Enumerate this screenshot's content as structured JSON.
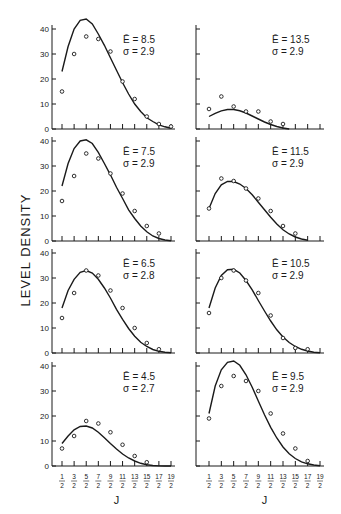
{
  "figure": {
    "y_axis_label": "LEVEL  DENSITY",
    "x_axis_label": "J",
    "x_tick_labels": [
      {
        "num": "1",
        "den": "2"
      },
      {
        "num": "3",
        "den": "2"
      },
      {
        "num": "5",
        "den": "2"
      },
      {
        "num": "7",
        "den": "2"
      },
      {
        "num": "9",
        "den": "2"
      },
      {
        "num": "11",
        "den": "2"
      },
      {
        "num": "13",
        "den": "2"
      },
      {
        "num": "15",
        "den": "2"
      },
      {
        "num": "17",
        "den": "2"
      },
      {
        "num": "19",
        "den": "2"
      }
    ],
    "y_tick_labels": [
      "0",
      "10",
      "20",
      "30",
      "40"
    ]
  },
  "chart_data": [
    {
      "type": "scatter",
      "panel": "left-1",
      "annotation": {
        "E": "Ē = 8.5",
        "sigma": "σ = 2.9"
      },
      "x": [
        0.5,
        1.5,
        2.5,
        3.5,
        4.5,
        5.5,
        6.5,
        7.5,
        8.5,
        9.5
      ],
      "points": [
        15,
        30,
        37,
        36,
        31,
        19,
        12,
        5,
        2,
        1
      ],
      "curve": [
        [
          0.5,
          23
        ],
        [
          1.0,
          33
        ],
        [
          1.5,
          40
        ],
        [
          2.0,
          43.5
        ],
        [
          2.5,
          44
        ],
        [
          3.0,
          42
        ],
        [
          3.5,
          38
        ],
        [
          4.0,
          33.5
        ],
        [
          4.5,
          28.5
        ],
        [
          5.0,
          23.5
        ],
        [
          5.5,
          18.5
        ],
        [
          6.0,
          14
        ],
        [
          6.5,
          10
        ],
        [
          7.0,
          7
        ],
        [
          7.5,
          4.5
        ],
        [
          8.0,
          3
        ],
        [
          8.5,
          1.7
        ],
        [
          9.0,
          0.9
        ],
        [
          9.5,
          0.3
        ]
      ],
      "xlabel": "J",
      "ylabel": "LEVEL DENSITY",
      "ylim": [
        0,
        45
      ]
    },
    {
      "type": "scatter",
      "panel": "right-1",
      "annotation": {
        "E": "Ē = 13.5",
        "sigma": "σ = 2.9"
      },
      "x": [
        0.5,
        1.5,
        2.5,
        3.5,
        4.5,
        5.5,
        6.5
      ],
      "points": [
        8,
        13,
        9,
        7,
        7,
        3,
        2
      ],
      "curve": [
        [
          0.5,
          5
        ],
        [
          1.0,
          6.3
        ],
        [
          1.5,
          7.3
        ],
        [
          2.0,
          7.8
        ],
        [
          2.5,
          7.8
        ],
        [
          3.0,
          7.3
        ],
        [
          3.5,
          6.4
        ],
        [
          4.0,
          5.2
        ],
        [
          4.5,
          4
        ],
        [
          5.0,
          2.8
        ],
        [
          5.5,
          1.8
        ],
        [
          6.0,
          1
        ],
        [
          6.5,
          0.4
        ],
        [
          7.0,
          0
        ]
      ],
      "xlabel": "J",
      "ylabel": "LEVEL DENSITY",
      "ylim": [
        0,
        45
      ]
    },
    {
      "type": "scatter",
      "panel": "left-2",
      "annotation": {
        "E": "Ē = 7.5",
        "sigma": "σ = 2.9"
      },
      "x": [
        0.5,
        1.5,
        2.5,
        3.5,
        4.5,
        5.5,
        6.5,
        7.5,
        8.5
      ],
      "points": [
        16,
        26,
        35,
        33,
        27,
        19,
        12,
        6,
        3
      ],
      "curve": [
        [
          0.5,
          22
        ],
        [
          1.0,
          31
        ],
        [
          1.5,
          37
        ],
        [
          2.0,
          40
        ],
        [
          2.5,
          40.5
        ],
        [
          3.0,
          39
        ],
        [
          3.5,
          35.5
        ],
        [
          4.0,
          31
        ],
        [
          4.5,
          26.5
        ],
        [
          5.0,
          21.5
        ],
        [
          5.5,
          17
        ],
        [
          6.0,
          12.5
        ],
        [
          6.5,
          9
        ],
        [
          7.0,
          6
        ],
        [
          7.5,
          3.7
        ],
        [
          8.0,
          2
        ],
        [
          8.5,
          1
        ],
        [
          9.0,
          0.4
        ],
        [
          9.5,
          0.1
        ]
      ],
      "xlabel": "J",
      "ylabel": "LEVEL DENSITY",
      "ylim": [
        0,
        42
      ]
    },
    {
      "type": "scatter",
      "panel": "right-2",
      "annotation": {
        "E": "Ē = 11.5",
        "sigma": "σ = 2.9"
      },
      "x": [
        0.5,
        1.5,
        2.5,
        3.5,
        4.5,
        5.5,
        6.5,
        7.5
      ],
      "points": [
        13,
        25,
        24,
        21,
        17,
        12,
        6,
        3
      ],
      "curve": [
        [
          0.5,
          13
        ],
        [
          1.0,
          19
        ],
        [
          1.5,
          22.5
        ],
        [
          2.0,
          23.8
        ],
        [
          2.5,
          23.8
        ],
        [
          3.0,
          22.8
        ],
        [
          3.5,
          21
        ],
        [
          4.0,
          18.5
        ],
        [
          4.5,
          15.5
        ],
        [
          5.0,
          12.5
        ],
        [
          5.5,
          9.5
        ],
        [
          6.0,
          6.8
        ],
        [
          6.5,
          4.5
        ],
        [
          7.0,
          2.8
        ],
        [
          7.5,
          1.6
        ],
        [
          8.0,
          0.8
        ],
        [
          8.5,
          0.3
        ]
      ],
      "xlabel": "J",
      "ylabel": "LEVEL DENSITY",
      "ylim": [
        0,
        42
      ]
    },
    {
      "type": "scatter",
      "panel": "left-3",
      "annotation": {
        "E": "Ē = 6.5",
        "sigma": "σ = 2.8"
      },
      "x": [
        0.5,
        1.5,
        2.5,
        3.5,
        4.5,
        5.5,
        6.5,
        7.5,
        8.5
      ],
      "points": [
        14,
        24,
        33,
        31,
        25,
        18,
        10,
        4,
        1.5
      ],
      "curve": [
        [
          0.5,
          18
        ],
        [
          1.0,
          25
        ],
        [
          1.5,
          29.5
        ],
        [
          2.0,
          32.3
        ],
        [
          2.5,
          33
        ],
        [
          3.0,
          32
        ],
        [
          3.5,
          29.5
        ],
        [
          4.0,
          26
        ],
        [
          4.5,
          22
        ],
        [
          5.0,
          17.5
        ],
        [
          5.5,
          13.5
        ],
        [
          6.0,
          9.8
        ],
        [
          6.5,
          6.7
        ],
        [
          7.0,
          4.3
        ],
        [
          7.5,
          2.6
        ],
        [
          8.0,
          1.4
        ],
        [
          8.5,
          0.7
        ],
        [
          9.0,
          0.3
        ],
        [
          9.5,
          0.1
        ]
      ],
      "xlabel": "J",
      "ylabel": "LEVEL DENSITY",
      "ylim": [
        0,
        42
      ]
    },
    {
      "type": "scatter",
      "panel": "right-3",
      "annotation": {
        "E": "Ē = 10.5",
        "sigma": "σ = 2.9"
      },
      "x": [
        0.5,
        1.5,
        2.5,
        3.5,
        4.5,
        5.5,
        6.5,
        7.5,
        8.5
      ],
      "points": [
        16,
        30,
        33,
        29,
        24,
        15,
        6,
        2,
        1.5
      ],
      "curve": [
        [
          0.5,
          18
        ],
        [
          1.0,
          26
        ],
        [
          1.5,
          31
        ],
        [
          2.0,
          33.3
        ],
        [
          2.5,
          33.5
        ],
        [
          3.0,
          32
        ],
        [
          3.5,
          29
        ],
        [
          4.0,
          25.3
        ],
        [
          4.5,
          21
        ],
        [
          5.0,
          16.8
        ],
        [
          5.5,
          12.8
        ],
        [
          6.0,
          9.3
        ],
        [
          6.5,
          6.4
        ],
        [
          7.0,
          4.2
        ],
        [
          7.5,
          2.6
        ],
        [
          8.0,
          1.5
        ],
        [
          8.5,
          0.8
        ],
        [
          9.0,
          0.3
        ],
        [
          9.5,
          0.1
        ]
      ],
      "xlabel": "J",
      "ylabel": "LEVEL DENSITY",
      "ylim": [
        0,
        42
      ]
    },
    {
      "type": "scatter",
      "panel": "left-4",
      "annotation": {
        "E": "Ē = 4.5",
        "sigma": "σ = 2.7"
      },
      "x": [
        0.5,
        1.5,
        2.5,
        3.5,
        4.5,
        5.5,
        6.5,
        7.5
      ],
      "points": [
        7,
        12,
        18,
        17,
        13.5,
        8.5,
        4,
        1.5
      ],
      "curve": [
        [
          0.5,
          9
        ],
        [
          1.0,
          12
        ],
        [
          1.5,
          14.5
        ],
        [
          2.0,
          15.8
        ],
        [
          2.5,
          16
        ],
        [
          3.0,
          15.2
        ],
        [
          3.5,
          13.5
        ],
        [
          4.0,
          11.3
        ],
        [
          4.5,
          9
        ],
        [
          5.0,
          6.8
        ],
        [
          5.5,
          4.8
        ],
        [
          6.0,
          3.2
        ],
        [
          6.5,
          2
        ],
        [
          7.0,
          1.1
        ],
        [
          7.5,
          0.5
        ],
        [
          8.0,
          0.2
        ],
        [
          8.5,
          0.05
        ],
        [
          9.0,
          0
        ],
        [
          9.5,
          0
        ]
      ],
      "xlabel": "J",
      "ylabel": "LEVEL DENSITY",
      "ylim": [
        0,
        42
      ]
    },
    {
      "type": "scatter",
      "panel": "right-4",
      "annotation": {
        "E": "Ē = 9.5",
        "sigma": "σ = 2.9"
      },
      "x": [
        0.5,
        1.5,
        2.5,
        3.5,
        4.5,
        5.5,
        6.5,
        7.5,
        8.5
      ],
      "points": [
        19,
        32,
        36,
        34,
        30,
        21,
        13,
        7,
        2
      ],
      "curve": [
        [
          0.5,
          21
        ],
        [
          1.0,
          32
        ],
        [
          1.5,
          38.5
        ],
        [
          2.0,
          41.5
        ],
        [
          2.5,
          42
        ],
        [
          3.0,
          40.3
        ],
        [
          3.5,
          36.5
        ],
        [
          4.0,
          31.5
        ],
        [
          4.5,
          26
        ],
        [
          5.0,
          20.5
        ],
        [
          5.5,
          15.5
        ],
        [
          6.0,
          11.2
        ],
        [
          6.5,
          7.6
        ],
        [
          7.0,
          4.9
        ],
        [
          7.5,
          3
        ],
        [
          8.0,
          1.7
        ],
        [
          8.5,
          0.9
        ],
        [
          9.0,
          0.4
        ],
        [
          9.5,
          0.1
        ]
      ],
      "xlabel": "J",
      "ylabel": "LEVEL DENSITY",
      "ylim": [
        0,
        42
      ]
    }
  ]
}
